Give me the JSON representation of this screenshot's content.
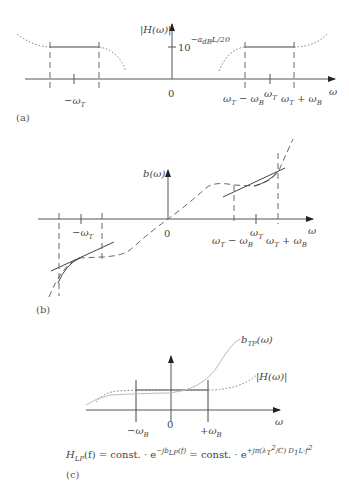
{
  "panels": {
    "a": {
      "caption": "(a)",
      "y_axis_label": "|H(ω)|",
      "level_label_base": "10",
      "level_label_exp": "−a",
      "level_label_exp_sub": "dB",
      "level_label_exp_rest": "L/20",
      "x_axis_label": "ω",
      "ticks": {
        "neg_wt": "−ω",
        "neg_wt_sub": "T",
        "zero": "0",
        "wt_minus_wb": "ω",
        "wt_minus_wb_sub1": "T",
        "wt_minus_wb_mid": " − ω",
        "wt_minus_wb_sub2": "B",
        "wt": "ω",
        "wt_sub": "T",
        "wt_plus_wb": "ω",
        "wt_plus_wb_sub1": "T",
        "wt_plus_wb_mid": " + ω",
        "wt_plus_wb_sub2": "B"
      }
    },
    "b": {
      "caption": "(b)",
      "y_axis_label": "b(ω)",
      "x_axis_label": "ω",
      "ticks": {
        "neg_wt": "−ω",
        "neg_wt_sub": "T",
        "zero": "0",
        "wt_minus_wb": "ω",
        "wt_minus_wb_sub1": "T",
        "wt_minus_wb_mid": " − ω",
        "wt_minus_wb_sub2": "B",
        "wt": "ω",
        "wt_sub": "T",
        "wt_plus_wb": "ω",
        "wt_plus_wb_sub1": "T",
        "wt_plus_wb_mid": " + ω",
        "wt_plus_wb_sub2": "B"
      }
    },
    "c": {
      "caption": "(c)",
      "curve1_label": "b",
      "curve1_label_sub": "TP",
      "curve1_label_rest": "(ω)",
      "curve2_label": "|H(ω)|",
      "x_axis_label": "ω",
      "ticks": {
        "neg_wb": "−ω",
        "neg_wb_sub": "B",
        "zero": "0",
        "pos_wb": "+ω",
        "pos_wb_sub": "B"
      },
      "equation": {
        "lhs": "H",
        "lhs_sub": "LP",
        "lhs_arg": "(f) = const. · e",
        "exp1": "−jb",
        "exp1_sub": "LP",
        "exp1_rest": "(f)",
        "mid": " = const. · e",
        "exp2": "+jπ(λ",
        "exp2_sub": "T",
        "exp2_sup": "2",
        "exp2_rest": "/C) D",
        "exp2_sub2": "1",
        "exp2_tail": "L·f",
        "exp2_sup2": "2"
      }
    }
  }
}
